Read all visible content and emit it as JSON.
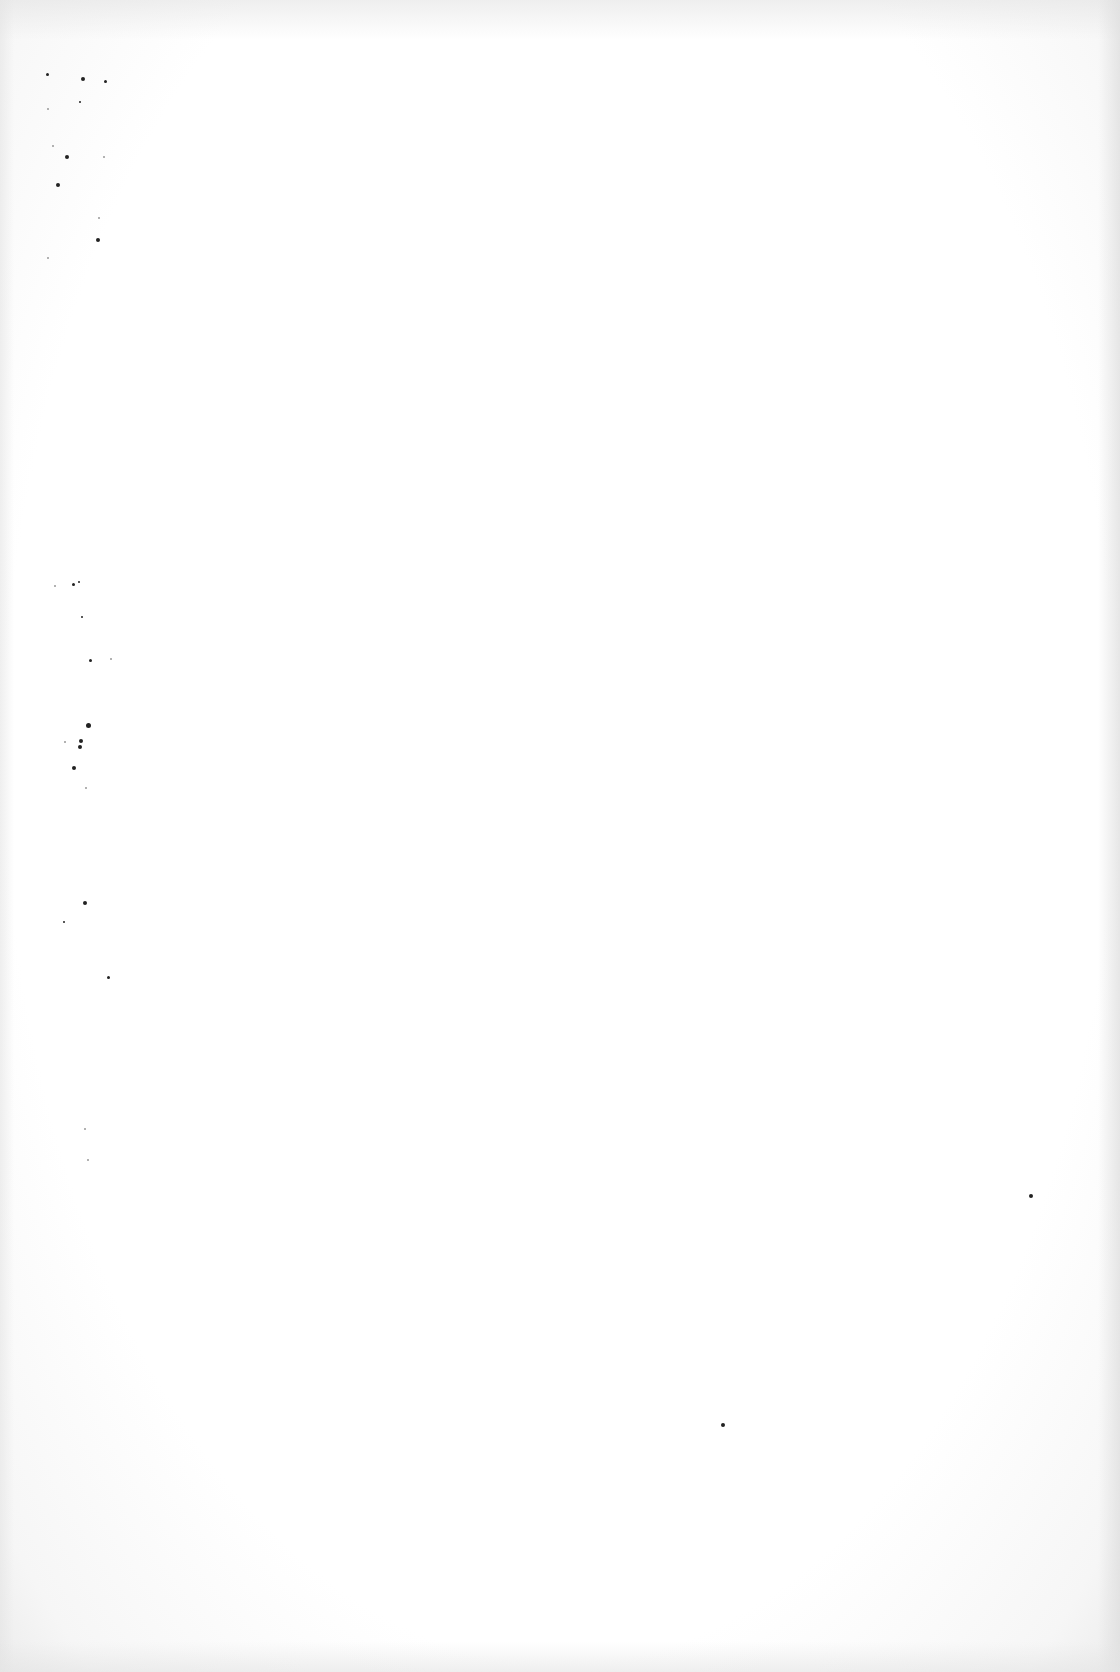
{
  "document": {
    "type": "blank-scanned-page",
    "text": "",
    "background_color": "#ffffff",
    "edge_shade_color": "#ececec",
    "speck_color": "#222222"
  },
  "specks": [
    {
      "x": 47,
      "y": 74,
      "r": 1.5,
      "light": false
    },
    {
      "x": 83,
      "y": 79,
      "r": 2,
      "light": false
    },
    {
      "x": 105,
      "y": 81,
      "r": 1.5,
      "light": false
    },
    {
      "x": 80,
      "y": 102,
      "r": 1,
      "light": false
    },
    {
      "x": 48,
      "y": 109,
      "r": 1,
      "light": true
    },
    {
      "x": 53,
      "y": 146,
      "r": 1,
      "light": true
    },
    {
      "x": 67,
      "y": 157,
      "r": 2,
      "light": false
    },
    {
      "x": 104,
      "y": 157,
      "r": 1,
      "light": true
    },
    {
      "x": 58,
      "y": 185,
      "r": 2,
      "light": false
    },
    {
      "x": 99,
      "y": 218,
      "r": 1,
      "light": true
    },
    {
      "x": 98,
      "y": 240,
      "r": 2,
      "light": false
    },
    {
      "x": 48,
      "y": 258,
      "r": 1,
      "light": true
    },
    {
      "x": 55,
      "y": 586,
      "r": 1,
      "light": true
    },
    {
      "x": 73,
      "y": 584,
      "r": 1.5,
      "light": false
    },
    {
      "x": 79,
      "y": 582,
      "r": 1,
      "light": false
    },
    {
      "x": 82,
      "y": 617,
      "r": 1,
      "light": false
    },
    {
      "x": 90,
      "y": 660,
      "r": 1.5,
      "light": false
    },
    {
      "x": 111,
      "y": 659,
      "r": 1,
      "light": true
    },
    {
      "x": 88,
      "y": 725,
      "r": 2.5,
      "light": false
    },
    {
      "x": 81,
      "y": 741,
      "r": 2,
      "light": false
    },
    {
      "x": 65,
      "y": 742,
      "r": 1,
      "light": true
    },
    {
      "x": 80,
      "y": 747,
      "r": 2,
      "light": false
    },
    {
      "x": 74,
      "y": 768,
      "r": 2,
      "light": false
    },
    {
      "x": 86,
      "y": 788,
      "r": 1,
      "light": true
    },
    {
      "x": 85,
      "y": 903,
      "r": 2,
      "light": false
    },
    {
      "x": 64,
      "y": 922,
      "r": 1,
      "light": false
    },
    {
      "x": 108,
      "y": 977,
      "r": 1.5,
      "light": false
    },
    {
      "x": 85,
      "y": 1129,
      "r": 1,
      "light": true
    },
    {
      "x": 88,
      "y": 1160,
      "r": 1,
      "light": true
    },
    {
      "x": 1031,
      "y": 1196,
      "r": 2,
      "light": false
    },
    {
      "x": 723,
      "y": 1425,
      "r": 2,
      "light": false
    }
  ]
}
